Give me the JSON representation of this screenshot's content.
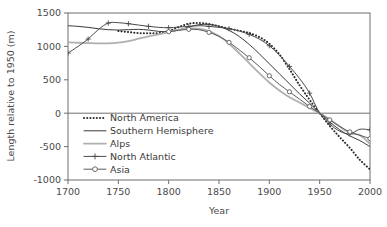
{
  "chart_data": {
    "type": "line",
    "title": "",
    "xlabel": "Year",
    "ylabel": "Length relative to 1950 (m)",
    "xlim": [
      1700,
      2000
    ],
    "ylim": [
      -1000,
      1500
    ],
    "xticks": [
      1700,
      1750,
      1800,
      1850,
      1900,
      1950,
      2000
    ],
    "xticklabels": [
      "1700",
      "1750",
      "1800",
      "1850",
      "1900",
      "1950",
      "2000"
    ],
    "yticks": [
      -1000,
      -500,
      0,
      500,
      1000,
      1500
    ],
    "yticklabels": [
      "-1000",
      "-500",
      "0",
      "500",
      "1000",
      "1500"
    ],
    "grid": false,
    "zero_line": true,
    "legend_position": "lower left (inside axes)",
    "series": [
      {
        "name": "North America",
        "style": "dotted",
        "color": "#2b2b2b",
        "marker": "none",
        "x": [
          1750,
          1760,
          1770,
          1780,
          1790,
          1800,
          1810,
          1820,
          1830,
          1840,
          1850,
          1860,
          1870,
          1880,
          1890,
          1900,
          1910,
          1920,
          1930,
          1940,
          1950,
          1960,
          1970,
          1980,
          1990,
          2000
        ],
        "values": [
          1230,
          1215,
          1200,
          1195,
          1200,
          1230,
          1290,
          1340,
          1350,
          1335,
          1300,
          1265,
          1235,
          1200,
          1140,
          1040,
          880,
          660,
          420,
          200,
          0,
          -190,
          -360,
          -520,
          -700,
          -840
        ]
      },
      {
        "name": "Southern Hemisphere",
        "style": "solid",
        "color": "#3a3a3a",
        "marker": "none",
        "x": [
          1700,
          1710,
          1720,
          1730,
          1740,
          1750,
          1760,
          1770,
          1780,
          1790,
          1800,
          1810,
          1820,
          1830,
          1840,
          1850,
          1860,
          1870,
          1880,
          1890,
          1900,
          1910,
          1920,
          1930,
          1940,
          1950,
          1960,
          1970,
          1980,
          1990,
          2000
        ],
        "values": [
          1310,
          1300,
          1285,
          1265,
          1250,
          1245,
          1250,
          1255,
          1245,
          1225,
          1220,
          1245,
          1290,
          1325,
          1330,
          1300,
          1240,
          1150,
          1030,
          890,
          740,
          590,
          440,
          290,
          150,
          0,
          -130,
          -250,
          -340,
          -410,
          -500
        ]
      },
      {
        "name": "Alps",
        "style": "solid",
        "color": "#b0b0b0",
        "marker": "none",
        "x": [
          1700,
          1710,
          1720,
          1730,
          1740,
          1750,
          1760,
          1770,
          1780,
          1790,
          1800,
          1810,
          1820,
          1830,
          1840,
          1850,
          1860,
          1870,
          1880,
          1890,
          1900,
          1910,
          1920,
          1930,
          1940,
          1950,
          1960,
          1970,
          1980,
          1990,
          2000
        ],
        "values": [
          1060,
          1055,
          1050,
          1045,
          1045,
          1055,
          1080,
          1115,
          1150,
          1180,
          1215,
          1250,
          1270,
          1265,
          1230,
          1155,
          1040,
          900,
          750,
          600,
          460,
          340,
          240,
          160,
          80,
          0,
          -90,
          -200,
          -300,
          -330,
          -460
        ]
      },
      {
        "name": "North Atlantic",
        "style": "solid-plus",
        "color": "#4a4a4a",
        "marker": "plus",
        "x": [
          1700,
          1710,
          1720,
          1730,
          1740,
          1750,
          1760,
          1770,
          1780,
          1790,
          1800,
          1810,
          1820,
          1830,
          1840,
          1850,
          1860,
          1870,
          1880,
          1890,
          1900,
          1910,
          1920,
          1930,
          1940,
          1950,
          1960,
          1970,
          1980,
          1990,
          2000
        ],
        "values": [
          900,
          1000,
          1110,
          1250,
          1350,
          1355,
          1340,
          1320,
          1300,
          1285,
          1280,
          1290,
          1300,
          1310,
          1300,
          1285,
          1265,
          1230,
          1180,
          1110,
          1010,
          870,
          700,
          520,
          300,
          0,
          -160,
          -270,
          -310,
          -240,
          -250
        ]
      },
      {
        "name": "Asia",
        "style": "solid-circle",
        "color": "#5a5a5a",
        "marker": "circle",
        "x": [
          1800,
          1810,
          1820,
          1830,
          1840,
          1850,
          1860,
          1870,
          1880,
          1890,
          1900,
          1910,
          1920,
          1930,
          1940,
          1950,
          1960,
          1970,
          1980,
          1990,
          2000
        ],
        "values": [
          1220,
          1240,
          1255,
          1250,
          1210,
          1150,
          1060,
          950,
          830,
          700,
          560,
          430,
          320,
          210,
          100,
          0,
          -100,
          -200,
          -280,
          -330,
          -380
        ]
      }
    ]
  },
  "legend": {
    "items": [
      {
        "label": "North America"
      },
      {
        "label": "Southern Hemisphere"
      },
      {
        "label": "Alps"
      },
      {
        "label": "North Atlantic"
      },
      {
        "label": "Asia"
      }
    ]
  }
}
